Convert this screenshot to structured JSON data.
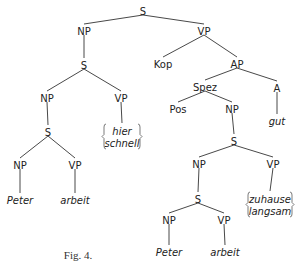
{
  "caption": "Fig. 4.",
  "nodes": [
    {
      "id": "s0",
      "label": "S",
      "x": 143,
      "y": 12,
      "kind": "cat"
    },
    {
      "id": "np1",
      "label": "NP",
      "x": 84,
      "y": 32,
      "kind": "cat"
    },
    {
      "id": "vp1",
      "label": "VP",
      "x": 204,
      "y": 32,
      "kind": "cat"
    },
    {
      "id": "s1",
      "label": "S",
      "x": 84,
      "y": 66,
      "kind": "cat"
    },
    {
      "id": "np2",
      "label": "NP",
      "x": 47,
      "y": 99,
      "kind": "cat"
    },
    {
      "id": "vp2",
      "label": "VP",
      "x": 121,
      "y": 99,
      "kind": "cat"
    },
    {
      "id": "s2",
      "label": "S",
      "x": 48,
      "y": 133,
      "kind": "cat"
    },
    {
      "id": "np3",
      "label": "NP",
      "x": 20,
      "y": 166,
      "kind": "cat"
    },
    {
      "id": "vp3",
      "label": "VP",
      "x": 75,
      "y": 166,
      "kind": "cat"
    },
    {
      "id": "peter1",
      "label": "Peter",
      "x": 20,
      "y": 201,
      "kind": "term"
    },
    {
      "id": "arbeit1",
      "label": "arbeit",
      "x": 75,
      "y": 201,
      "kind": "term"
    },
    {
      "id": "kop",
      "label": "Kop",
      "x": 163,
      "y": 65,
      "kind": "cat"
    },
    {
      "id": "ap",
      "label": "AP",
      "x": 237,
      "y": 65,
      "kind": "cat"
    },
    {
      "id": "spez",
      "label": "Spez",
      "x": 205,
      "y": 88,
      "kind": "cat"
    },
    {
      "id": "a",
      "label": "A",
      "x": 277,
      "y": 89,
      "kind": "cat"
    },
    {
      "id": "gut",
      "label": "gut",
      "x": 277,
      "y": 122,
      "kind": "term"
    },
    {
      "id": "pos",
      "label": "Pos",
      "x": 178,
      "y": 110,
      "kind": "cat"
    },
    {
      "id": "np4",
      "label": "NP",
      "x": 232,
      "y": 110,
      "kind": "cat"
    },
    {
      "id": "s3",
      "label": "S",
      "x": 234,
      "y": 142,
      "kind": "cat"
    },
    {
      "id": "np5",
      "label": "NP",
      "x": 199,
      "y": 165,
      "kind": "cat"
    },
    {
      "id": "vp5",
      "label": "VP",
      "x": 273,
      "y": 165,
      "kind": "cat"
    },
    {
      "id": "s4",
      "label": "S",
      "x": 198,
      "y": 200,
      "kind": "cat"
    },
    {
      "id": "np6",
      "label": "NP",
      "x": 169,
      "y": 221,
      "kind": "cat"
    },
    {
      "id": "vp6",
      "label": "VP",
      "x": 224,
      "y": 221,
      "kind": "cat"
    },
    {
      "id": "peter2",
      "label": "Peter",
      "x": 169,
      "y": 253,
      "kind": "term"
    },
    {
      "id": "arbeit2",
      "label": "arbeit",
      "x": 225,
      "y": 253,
      "kind": "term"
    }
  ],
  "braces": [
    {
      "id": "hier-schnell",
      "lines": [
        "hier",
        "schnell"
      ],
      "x": 122,
      "y": 132,
      "w": 36,
      "attach": "vp2"
    },
    {
      "id": "zuhause-langsam",
      "lines": [
        "zuhause",
        "langsam"
      ],
      "x": 270,
      "y": 200,
      "w": 44,
      "attach": "vp5"
    }
  ],
  "edges": [
    [
      "s0",
      "np1"
    ],
    [
      "s0",
      "vp1"
    ],
    [
      "np1",
      "s1"
    ],
    [
      "s1",
      "np2"
    ],
    [
      "s1",
      "vp2"
    ],
    [
      "np2",
      "s2"
    ],
    [
      "s2",
      "np3"
    ],
    [
      "s2",
      "vp3"
    ],
    [
      "np3",
      "peter1"
    ],
    [
      "vp3",
      "arbeit1"
    ],
    [
      "vp1",
      "kop"
    ],
    [
      "vp1",
      "ap"
    ],
    [
      "ap",
      "spez"
    ],
    [
      "ap",
      "a"
    ],
    [
      "a",
      "gut"
    ],
    [
      "spez",
      "pos"
    ],
    [
      "spez",
      "np4"
    ],
    [
      "np4",
      "s3"
    ],
    [
      "s3",
      "np5"
    ],
    [
      "s3",
      "vp5"
    ],
    [
      "np5",
      "s4"
    ],
    [
      "s4",
      "np6"
    ],
    [
      "s4",
      "vp6"
    ],
    [
      "np6",
      "peter2"
    ],
    [
      "vp6",
      "arbeit2"
    ]
  ],
  "caption_pos": {
    "x": 78,
    "y": 259
  }
}
